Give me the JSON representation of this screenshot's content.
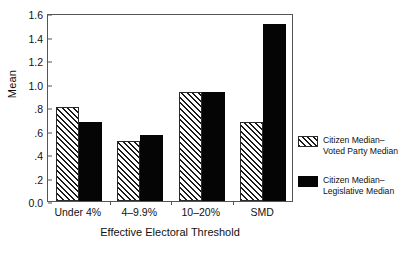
{
  "chart_data": {
    "type": "bar",
    "title": "",
    "xlabel": "Effective Electoral Threshold",
    "ylabel": "Mean",
    "categories": [
      "Under 4%",
      "4–9.9%",
      "10–20%",
      "SMD"
    ],
    "series": [
      {
        "name": "Citizen Median–\nVoted Party Median",
        "fill": "hatched",
        "values": [
          0.8,
          0.51,
          0.93,
          0.67
        ]
      },
      {
        "name": "Citizen Median–\nLegislative Median",
        "fill": "solid",
        "values": [
          0.67,
          0.56,
          0.93,
          1.51
        ]
      }
    ],
    "ylim": [
      0.0,
      1.6
    ],
    "yticks": [
      "0.0",
      ".2",
      ".4",
      ".6",
      ".8",
      "1.0",
      "1.2",
      "1.4",
      "1.6"
    ],
    "ytick_values": [
      0.0,
      0.2,
      0.4,
      0.6,
      0.8,
      1.0,
      1.2,
      1.4,
      1.6
    ],
    "grid": false,
    "legend_position": "right"
  },
  "legend": {
    "items": [
      {
        "label": "Citizen Median–\nVoted Party Median",
        "fill": "hatched"
      },
      {
        "label": "Citizen Median–\nLegislative Median",
        "fill": "solid"
      }
    ]
  },
  "colors": {
    "bar_solid": "#050505",
    "bar_hatch": "#1a1a1a",
    "axis": "#555555",
    "text": "#111111",
    "background": "#ffffff"
  }
}
